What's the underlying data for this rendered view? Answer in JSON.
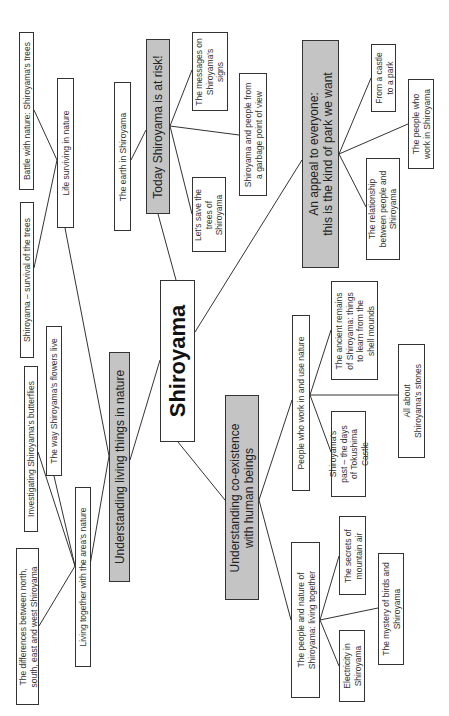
{
  "diagram": {
    "type": "mind-map",
    "orientation": "rotated-90-ccw",
    "colors": {
      "root_fill": "#ffffff",
      "branch_fill": "#c4c4c4",
      "leaf_fill": "#ffffff",
      "border": "#333333",
      "line": "#333333"
    },
    "root": {
      "label": "Shiroyama"
    },
    "branches": [
      {
        "label": "Understanding living things in nature",
        "children": [
          {
            "label": "Life surviving in nature",
            "children": [
              {
                "label": "Battle with nature: Shiroyama's trees"
              },
              {
                "label": "Shiroyama – survival of the trees"
              }
            ]
          },
          {
            "label": "Living together with the area's nature",
            "children": [
              {
                "label": "The way Shiroyama's flowers live"
              },
              {
                "label": "Investigating Shiroyama's butterflies"
              },
              {
                "label": "The differences between north,\nsouth, east and west Shiroyama"
              }
            ]
          }
        ]
      },
      {
        "label": "Today Shiroyama is at risk!",
        "children": [
          {
            "label": "The earth in Shiroyama"
          },
          {
            "label": "The messages on\nShiroyama's\nsigns"
          },
          {
            "label": "Shiroyama and people from\na garbage point of view"
          },
          {
            "label": "Let's save the\ntrees of\nShiroyama"
          }
        ]
      },
      {
        "label": "An appeal to everyone:\nthis is the kind of park we want",
        "children": [
          {
            "label": "From a castle\nto a park"
          },
          {
            "label": "The people who\nwork in Shiroyama"
          },
          {
            "label": "The relationship\nbetween people and\nShiroyama"
          }
        ]
      },
      {
        "label": "Understanding co-existence\nwith human beings",
        "children": [
          {
            "label": "People who work in and use nature",
            "children": [
              {
                "label": "The ancient remains\nof Shiroyama: things\nto learn from the\nshell mounds"
              },
              {
                "label": "All about\nShiroyama's stones"
              },
              {
                "label": "Shiroyama's\npast – the days\nof Tokushima\nCastle"
              }
            ]
          },
          {
            "label": "The people and nature of\nShiroyama: living together",
            "children": [
              {
                "label": "The secrets of\nmountain air"
              },
              {
                "label": "The mystery of birds and\nShiroyama"
              },
              {
                "label": "Electricity in\nShiroyama"
              }
            ]
          }
        ]
      }
    ]
  }
}
